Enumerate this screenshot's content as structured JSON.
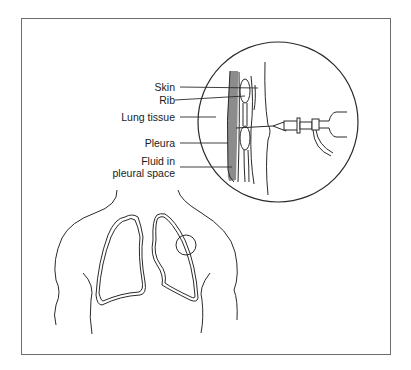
{
  "figure": {
    "labels": [
      {
        "id": "skin",
        "text": "Skin"
      },
      {
        "id": "rib",
        "text": "Rib"
      },
      {
        "id": "lung-tissue",
        "text": "Lung tissue"
      },
      {
        "id": "pleura",
        "text": "Pleura"
      },
      {
        "id": "fluid-line1",
        "text": "Fluid in"
      },
      {
        "id": "fluid-line2",
        "text": "pleural space"
      }
    ],
    "colors": {
      "line": "#2a2a2a",
      "fluid_fill": "#8c8c8c",
      "frame": "#6e6e6e",
      "background": "#ffffff"
    }
  }
}
